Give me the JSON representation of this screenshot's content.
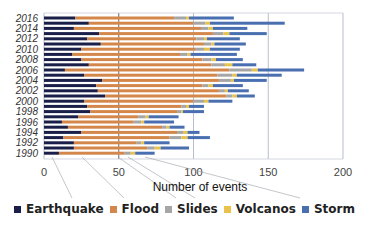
{
  "chart_data": {
    "type": "bar",
    "orientation": "horizontal",
    "stacked": true,
    "title": "",
    "xlabel": "Number of events",
    "ylabel": "",
    "xlim": [
      0,
      200
    ],
    "x_ticks": [
      0,
      50,
      100,
      150,
      200
    ],
    "grid": true,
    "legend_position": "bottom",
    "categories": [
      "1990",
      "1991",
      "1992",
      "1993",
      "1994",
      "1995",
      "1996",
      "1997",
      "1998",
      "1999",
      "2000",
      "2001",
      "2002",
      "2003",
      "2004",
      "2005",
      "2006",
      "2007",
      "2008",
      "2009",
      "2010",
      "2011",
      "2012",
      "2013",
      "2014",
      "2015",
      "2016"
    ],
    "y_tick_labels": [
      "1990",
      "1992",
      "1994",
      "1996",
      "1998",
      "2000",
      "2002",
      "2004",
      "2006",
      "2008",
      "2010",
      "2012",
      "2014",
      "2016"
    ],
    "series": [
      {
        "name": "Earthquake",
        "color": "#1a1f4a",
        "values": [
          10,
          20,
          20,
          13,
          25,
          16,
          12,
          23,
          31,
          29,
          27,
          41,
          36,
          35,
          39,
          27,
          14,
          30,
          25,
          19,
          25,
          38,
          29,
          37,
          20,
          30,
          21
        ]
      },
      {
        "name": "Flood",
        "color": "#d4874a",
        "values": [
          44,
          49,
          42,
          71,
          64,
          63,
          48,
          40,
          58,
          63,
          73,
          81,
          81,
          71,
          78,
          89,
          110,
          82,
          81,
          72,
          76,
          69,
          73,
          76,
          85,
          70,
          66
        ]
      },
      {
        "name": "Slides",
        "color": "#a6a6a6",
        "values": [
          4,
          5,
          3,
          8,
          4,
          3,
          5,
          5,
          3,
          3,
          7,
          4,
          4,
          4,
          8,
          10,
          15,
          9,
          6,
          5,
          6,
          5,
          5,
          7,
          5,
          8,
          8
        ]
      },
      {
        "name": "Volcanos",
        "color": "#e8c24a",
        "values": [
          3,
          4,
          2,
          4,
          3,
          2,
          2,
          2,
          1,
          2,
          3,
          3,
          2,
          3,
          2,
          3,
          4,
          5,
          3,
          2,
          4,
          2,
          2,
          4,
          3,
          3,
          2
        ]
      },
      {
        "name": "Storm",
        "color": "#4a6fb0",
        "values": [
          13,
          19,
          17,
          15,
          8,
          10,
          20,
          20,
          14,
          10,
          16,
          12,
          14,
          20,
          22,
          30,
          31,
          16,
          18,
          31,
          20,
          21,
          22,
          25,
          23,
          50,
          30
        ]
      }
    ]
  },
  "axis": {
    "x_title": "Number of events",
    "x_ticks": [
      "0",
      "50",
      "100",
      "150",
      "200"
    ]
  },
  "legend": [
    {
      "label": "Earthquake",
      "color": "#1a1f4a"
    },
    {
      "label": "Flood",
      "color": "#d4874a"
    },
    {
      "label": "Slides",
      "color": "#a6a6a6"
    },
    {
      "label": "Volcanos",
      "color": "#e8c24a"
    },
    {
      "label": "Storm",
      "color": "#4a6fb0"
    }
  ]
}
